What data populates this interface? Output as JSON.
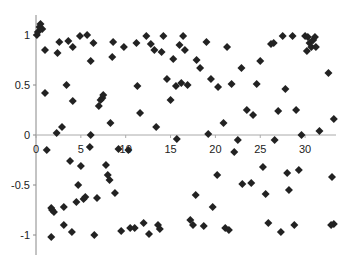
{
  "chart_data": {
    "type": "scatter",
    "title": "",
    "xlabel": "",
    "ylabel": "",
    "xlim": [
      0,
      33.5
    ],
    "ylim": [
      -1.2,
      1.2
    ],
    "grid": false,
    "legend": null,
    "marker": "diamond",
    "marker_color": "#222222",
    "x_ticks": [
      0,
      5,
      10,
      15,
      20,
      25,
      30
    ],
    "y_ticks": [
      -1,
      -0.5,
      0,
      0.5,
      1
    ],
    "x_tick_labels": [
      "0",
      "5",
      "10",
      "15",
      "20",
      "25",
      "30"
    ],
    "y_tick_labels": [
      "-1",
      "-0.5",
      "0",
      "0.5",
      "1"
    ],
    "points": [
      [
        0.1,
        1.0
      ],
      [
        0.2,
        1.03
      ],
      [
        0.4,
        1.08
      ],
      [
        0.5,
        1.11
      ],
      [
        0.7,
        1.06
      ],
      [
        1.0,
        0.85
      ],
      [
        1.0,
        0.42
      ],
      [
        1.2,
        -0.15
      ],
      [
        1.7,
        -0.73
      ],
      [
        1.8,
        -0.75
      ],
      [
        2.0,
        -0.77
      ],
      [
        1.7,
        -1.02
      ],
      [
        2.3,
        0.02
      ],
      [
        2.4,
        0.82
      ],
      [
        2.6,
        0.93
      ],
      [
        2.9,
        0.08
      ],
      [
        3.1,
        -0.72
      ],
      [
        3.1,
        -0.9
      ],
      [
        3.4,
        0.5
      ],
      [
        3.6,
        0.94
      ],
      [
        3.8,
        -0.26
      ],
      [
        4.1,
        0.34
      ],
      [
        4.0,
        -0.97
      ],
      [
        4.1,
        0.88
      ],
      [
        4.5,
        -0.67
      ],
      [
        4.7,
        -0.5
      ],
      [
        4.9,
        0.99
      ],
      [
        5.0,
        -0.31
      ],
      [
        5.3,
        -0.64
      ],
      [
        5.5,
        -0.62
      ],
      [
        5.7,
        1.0
      ],
      [
        6.0,
        -0.12
      ],
      [
        6.1,
        0.0
      ],
      [
        6.1,
        0.74
      ],
      [
        6.4,
        0.92
      ],
      [
        6.5,
        -1.0
      ],
      [
        6.8,
        -0.63
      ],
      [
        7.0,
        0.29
      ],
      [
        7.2,
        0.35
      ],
      [
        7.4,
        0.37
      ],
      [
        7.5,
        0.4
      ],
      [
        7.8,
        -0.3
      ],
      [
        8.0,
        -0.4
      ],
      [
        8.2,
        -0.45
      ],
      [
        8.3,
        0.12
      ],
      [
        8.5,
        0.78
      ],
      [
        8.6,
        0.93
      ],
      [
        8.8,
        -0.58
      ],
      [
        9.2,
        -0.14
      ],
      [
        9.5,
        -0.96
      ],
      [
        9.8,
        0.88
      ],
      [
        10.3,
        -0.15
      ],
      [
        10.5,
        -0.93
      ],
      [
        11.0,
        -0.93
      ],
      [
        11.2,
        0.92
      ],
      [
        11.3,
        0.49
      ],
      [
        11.6,
        0.22
      ],
      [
        12.0,
        -0.88
      ],
      [
        12.3,
        0.99
      ],
      [
        12.6,
        -0.99
      ],
      [
        12.8,
        0.91
      ],
      [
        13.2,
        0.85
      ],
      [
        13.4,
        0.08
      ],
      [
        13.6,
        -0.9
      ],
      [
        13.8,
        -0.94
      ],
      [
        14.0,
        0.83
      ],
      [
        14.2,
        0.99
      ],
      [
        14.6,
        0.56
      ],
      [
        15.0,
        0.35
      ],
      [
        15.3,
        0.76
      ],
      [
        15.6,
        0.49
      ],
      [
        15.7,
        -0.04
      ],
      [
        16.0,
        0.9
      ],
      [
        16.2,
        0.52
      ],
      [
        16.4,
        0.99
      ],
      [
        16.6,
        0.85
      ],
      [
        16.9,
        0.5
      ],
      [
        17.2,
        -0.85
      ],
      [
        17.5,
        -0.9
      ],
      [
        17.8,
        -0.6
      ],
      [
        17.9,
        0.75
      ],
      [
        18.3,
        0.67
      ],
      [
        18.7,
        -0.91
      ],
      [
        19.0,
        0.93
      ],
      [
        19.2,
        0.01
      ],
      [
        19.5,
        0.56
      ],
      [
        19.7,
        -0.72
      ],
      [
        20.2,
        -0.4
      ],
      [
        20.3,
        0.48
      ],
      [
        20.9,
        0.12
      ],
      [
        21.1,
        -0.93
      ],
      [
        21.3,
        0.88
      ],
      [
        21.5,
        -0.95
      ],
      [
        21.8,
        0.51
      ],
      [
        22.1,
        -0.17
      ],
      [
        22.5,
        -0.05
      ],
      [
        22.9,
        0.67
      ],
      [
        23.0,
        -0.49
      ],
      [
        23.5,
        0.25
      ],
      [
        24.0,
        -0.48
      ],
      [
        24.2,
        0.2
      ],
      [
        24.6,
        0.51
      ],
      [
        25.0,
        0.74
      ],
      [
        25.3,
        -0.32
      ],
      [
        25.6,
        -0.59
      ],
      [
        25.9,
        -0.88
      ],
      [
        26.2,
        0.91
      ],
      [
        26.5,
        0.92
      ],
      [
        26.6,
        -0.05
      ],
      [
        27.0,
        0.24
      ],
      [
        27.3,
        -0.97
      ],
      [
        27.5,
        0.99
      ],
      [
        27.8,
        0.46
      ],
      [
        28.0,
        -0.38
      ],
      [
        28.2,
        -0.55
      ],
      [
        28.6,
        0.99
      ],
      [
        28.8,
        -0.9
      ],
      [
        29.0,
        0.25
      ],
      [
        29.3,
        -0.35
      ],
      [
        29.6,
        0.0
      ],
      [
        30.0,
        0.99
      ],
      [
        30.2,
        0.84
      ],
      [
        30.3,
        0.98
      ],
      [
        30.5,
        0.92
      ],
      [
        30.7,
        0.88
      ],
      [
        30.9,
        0.95
      ],
      [
        31.1,
        0.98
      ],
      [
        31.2,
        0.88
      ],
      [
        31.6,
        0.04
      ],
      [
        32.6,
        0.62
      ],
      [
        33.0,
        -0.42
      ],
      [
        33.2,
        -0.89
      ],
      [
        33.2,
        0.16
      ],
      [
        32.9,
        -0.9
      ]
    ]
  },
  "axes": {
    "x_origin_label": "0"
  }
}
